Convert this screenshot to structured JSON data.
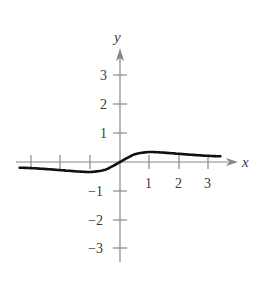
{
  "chart_data": {
    "type": "line",
    "title": "",
    "xlabel": "x",
    "ylabel": "y",
    "xlim": [
      -3.6,
      3.6
    ],
    "ylim": [
      -3.6,
      3.6
    ],
    "grid": false,
    "x_ticks": [
      -3,
      -2,
      -1,
      1,
      2,
      3
    ],
    "x_tick_labels": [
      "1",
      "2",
      "3"
    ],
    "y_ticks": [
      -3,
      -2,
      -1,
      1,
      2,
      3
    ],
    "y_tick_labels": [
      "3",
      "2",
      "1",
      "−1",
      "−2",
      "−3"
    ],
    "series": [
      {
        "name": "f(x)",
        "x": [
          -3.5,
          -3,
          -2.5,
          -2,
          -1.5,
          -1,
          -0.5,
          0,
          0.5,
          1,
          1.5,
          2,
          2.5,
          3,
          3.5
        ],
        "values": [
          -0.19,
          -0.21,
          -0.24,
          -0.28,
          -0.32,
          -0.35,
          -0.28,
          0,
          0.28,
          0.35,
          0.32,
          0.28,
          0.24,
          0.21,
          0.19
        ]
      }
    ]
  },
  "labels": {
    "x_axis": "x",
    "y_axis": "y",
    "x_ticks": [
      "1",
      "2",
      "3"
    ],
    "y_ticks_pos": [
      "3",
      "2",
      "1"
    ],
    "y_ticks_neg": [
      "−1",
      "−2",
      "−3"
    ]
  }
}
